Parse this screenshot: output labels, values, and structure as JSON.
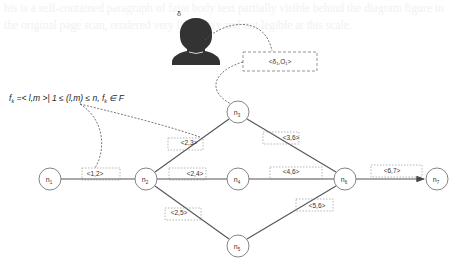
{
  "diagram": {
    "type": "network-graph",
    "formula": "f_k = <l,m> | 1 ≤ (l,m) ≤ n, f_k ∈ F",
    "formula_parts": {
      "lhs": "f",
      "lhs_sub": "k",
      "rest": " =< l,m >| 1 ≤ (l,m) ≤ n, ",
      "f2": "f",
      "f2_sub": "k",
      "tail": " ∈ F"
    },
    "user": {
      "label": "δ",
      "icon": "person-icon"
    },
    "user_tag": "<δ₁,O₁>",
    "nodes": [
      {
        "id": "n1",
        "label": "n",
        "sub": "1",
        "x": 50,
        "y": 179
      },
      {
        "id": "n2",
        "label": "n",
        "sub": "2",
        "x": 146,
        "y": 179
      },
      {
        "id": "n3",
        "label": "n",
        "sub": "3",
        "x": 238,
        "y": 112
      },
      {
        "id": "n4",
        "label": "n",
        "sub": "4",
        "x": 238,
        "y": 179
      },
      {
        "id": "n5",
        "label": "n",
        "sub": "5",
        "x": 238,
        "y": 246
      },
      {
        "id": "n6",
        "label": "n",
        "sub": "6",
        "x": 345,
        "y": 179
      },
      {
        "id": "n7",
        "label": "n",
        "sub": "7",
        "x": 437,
        "y": 179
      }
    ],
    "edges": [
      {
        "from": "n1",
        "to": "n2",
        "label": "<1,2>"
      },
      {
        "from": "n2",
        "to": "n3",
        "label": "<2,3>"
      },
      {
        "from": "n2",
        "to": "n4",
        "label": "<2,4>"
      },
      {
        "from": "n2",
        "to": "n5",
        "label": "<2,5>"
      },
      {
        "from": "n3",
        "to": "n6",
        "label": "<3,6>"
      },
      {
        "from": "n4",
        "to": "n6",
        "label": "<4,6>"
      },
      {
        "from": "n5",
        "to": "n6",
        "label": "<5,6>"
      },
      {
        "from": "n6",
        "to": "n7",
        "label": "<6,7>",
        "arrow": true
      }
    ],
    "colors": {
      "line": "#555555",
      "node_stroke": "#777777",
      "dash": "#666666",
      "person": "#333333",
      "text": "#333333"
    }
  },
  "background_text": "his is a self-contained paragraph of faint body text partially visible behind the diagram figure in the original page scan, rendered very light gray and not legible at this scale."
}
